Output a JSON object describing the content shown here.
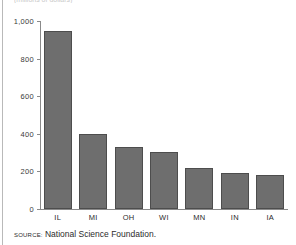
{
  "figure": {
    "title_fragment": "(millions of dollars)",
    "source_prefix": "SOURCE:",
    "source_text": "National Science Foundation.",
    "bar_color": "#6e6e6e",
    "bar_outline_color": "#4d4d4d",
    "axis_color": "#8a8a8a",
    "rule_color": "#b9b9b9",
    "text_color": "#2b2b2b"
  },
  "chart_data": {
    "type": "bar",
    "title": "",
    "subtitle": "(millions of dollars)",
    "xlabel": "",
    "ylabel": "",
    "categories": [
      "IL",
      "MI",
      "OH",
      "WI",
      "MN",
      "IN",
      "IA"
    ],
    "values": [
      945,
      400,
      330,
      303,
      218,
      191,
      181
    ],
    "ylim": [
      0,
      1000
    ],
    "yticks": [
      0,
      200,
      400,
      600,
      800,
      1000
    ],
    "ytick_labels": [
      "0",
      "200",
      "400",
      "600",
      "800",
      "1,000"
    ],
    "grid": false,
    "legend": false,
    "orientation": "vertical",
    "source": "SOURCE: National Science Foundation."
  }
}
